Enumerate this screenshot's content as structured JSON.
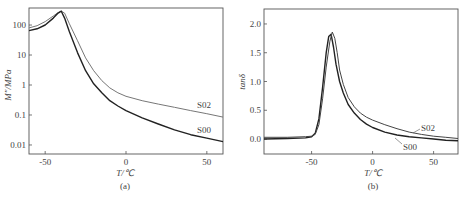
{
  "chart_data": [
    {
      "id": "a",
      "type": "line",
      "caption": "(a)",
      "xlabel": "T/℃",
      "ylabel": "M″/MPa",
      "yscale": "log",
      "xlim": [
        -60,
        60
      ],
      "ylim": [
        0.005,
        370
      ],
      "xticks": [
        -50,
        0,
        50
      ],
      "xtick_labels": [
        "-50",
        "0",
        "50"
      ],
      "yticks": [
        0.01,
        0.1,
        1,
        10,
        100
      ],
      "ytick_labels": [
        "0.01",
        "0.1",
        "1",
        "10",
        "100"
      ],
      "grid": false,
      "legend": "inline labels at right",
      "series": [
        {
          "name": "S02",
          "color": "#777777",
          "x": [
            -60,
            -55,
            -50,
            -45,
            -42,
            -40,
            -38,
            -35,
            -30,
            -25,
            -20,
            -15,
            -10,
            -5,
            0,
            10,
            20,
            30,
            40,
            50,
            60
          ],
          "y": [
            80,
            95,
            130,
            200,
            260,
            290,
            250,
            110,
            30,
            8,
            3,
            1.4,
            0.8,
            0.55,
            0.42,
            0.3,
            0.23,
            0.18,
            0.14,
            0.11,
            0.085
          ]
        },
        {
          "name": "S00",
          "color": "#222222",
          "x": [
            -60,
            -55,
            -50,
            -45,
            -42,
            -40,
            -38,
            -35,
            -30,
            -25,
            -20,
            -15,
            -10,
            -5,
            0,
            10,
            20,
            30,
            40,
            50,
            60
          ],
          "y": [
            65,
            75,
            100,
            170,
            250,
            290,
            170,
            60,
            12,
            3,
            1.1,
            0.55,
            0.3,
            0.2,
            0.14,
            0.08,
            0.05,
            0.032,
            0.022,
            0.017,
            0.013
          ]
        }
      ]
    },
    {
      "id": "b",
      "type": "line",
      "caption": "(b)",
      "xlabel": "T/℃",
      "ylabel": "tanδ",
      "yscale": "linear",
      "xlim": [
        -89,
        70
      ],
      "ylim": [
        -0.26,
        2.26
      ],
      "xticks": [
        -50,
        0,
        50
      ],
      "xtick_labels": [
        "-50",
        "0",
        "50"
      ],
      "yticks": [
        0.0,
        0.5,
        1.0,
        1.5,
        2.0
      ],
      "ytick_labels": [
        "0.0",
        "0.5",
        "1.0",
        "1.5",
        "2.0"
      ],
      "grid": false,
      "legend": "inline labels with leader lines",
      "series": [
        {
          "name": "S00",
          "color": "#222222",
          "x": [
            -89,
            -70,
            -55,
            -50,
            -47,
            -44,
            -41,
            -38,
            -36,
            -34,
            -32,
            -30,
            -27,
            -24,
            -20,
            -15,
            -10,
            -5,
            0,
            10,
            20,
            30,
            40,
            50,
            60,
            70
          ],
          "y": [
            0.0,
            0.01,
            0.02,
            0.04,
            0.1,
            0.35,
            0.9,
            1.5,
            1.78,
            1.82,
            1.6,
            1.3,
            1.0,
            0.8,
            0.6,
            0.45,
            0.34,
            0.26,
            0.2,
            0.12,
            0.07,
            0.04,
            0.02,
            0.0,
            -0.02,
            -0.03
          ]
        },
        {
          "name": "S02",
          "color": "#444444",
          "x": [
            -89,
            -70,
            -55,
            -50,
            -47,
            -44,
            -41,
            -38,
            -35,
            -33,
            -31,
            -29,
            -27,
            -24,
            -20,
            -15,
            -10,
            -5,
            0,
            10,
            20,
            30,
            40,
            50,
            60,
            70
          ],
          "y": [
            0.03,
            0.03,
            0.04,
            0.05,
            0.08,
            0.25,
            0.7,
            1.25,
            1.7,
            1.86,
            1.75,
            1.5,
            1.2,
            0.95,
            0.72,
            0.56,
            0.45,
            0.38,
            0.33,
            0.25,
            0.18,
            0.12,
            0.08,
            0.05,
            0.03,
            0.01
          ]
        }
      ]
    }
  ]
}
